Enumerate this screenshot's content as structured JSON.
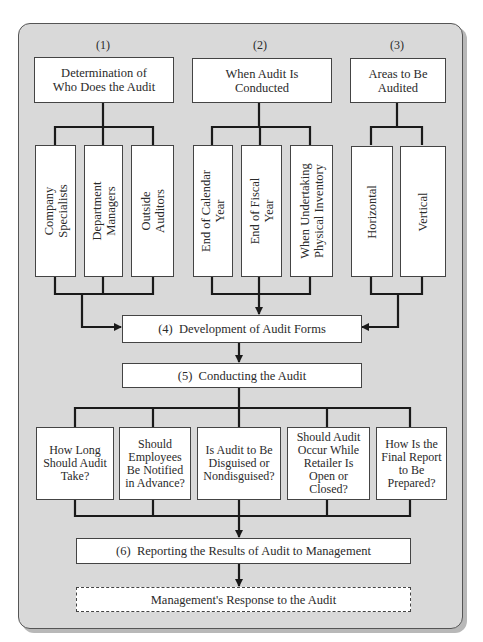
{
  "diagram": {
    "type": "flowchart",
    "stages": [
      {
        "number": "(1)",
        "label": "Determination of\nWho Does the Audit",
        "options": [
          "Company\nSpecialists",
          "Department\nManagers",
          "Outside\nAuditors"
        ]
      },
      {
        "number": "(2)",
        "label": "When Audit Is\nConducted",
        "options": [
          "End of Calendar\nYear",
          "End of Fiscal\nYear",
          "When Undertaking\nPhysical Inventory"
        ]
      },
      {
        "number": "(3)",
        "label": "Areas to Be\nAudited",
        "options": [
          "Horizontal",
          "Vertical"
        ]
      }
    ],
    "step4": "(4)  Development of Audit Forms",
    "step5": "(5)  Conducting the Audit",
    "questions": [
      "How Long\nShould Audit\nTake?",
      "Should\nEmployees\nBe Notified\nin Advance?",
      "Is Audit to Be\nDisguised or\nNondisguised?",
      "Should Audit\nOccur While\nRetailer Is\nOpen or\nClosed?",
      "How Is the\nFinal Report\nto Be\nPrepared?"
    ],
    "step6": "(6)  Reporting the Results of Audit to Management",
    "final": "Management's Response to the Audit",
    "colors": {
      "panel": "#d9d9d9",
      "box": "#ffffff",
      "line": "#1a1a1a"
    }
  }
}
